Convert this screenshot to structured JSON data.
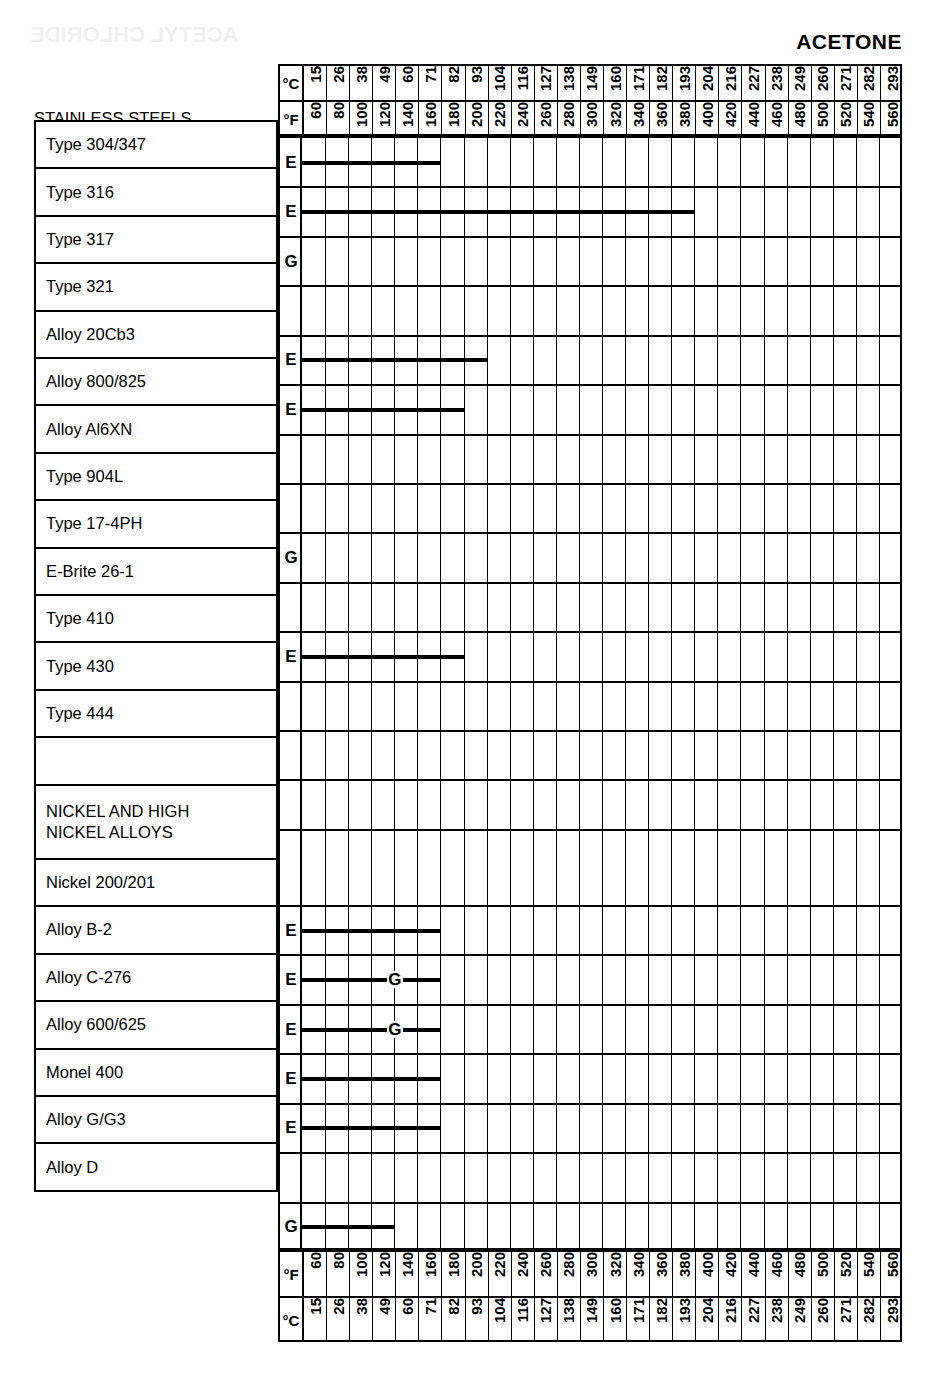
{
  "title": "ACETONE",
  "bleedthrough_text": "ACETYL CHLORIDE",
  "axis": {
    "celsius_label": "°C",
    "fahrenheit_label": "°F",
    "celsius_ticks": [
      "15",
      "26",
      "38",
      "49",
      "60",
      "71",
      "82",
      "93",
      "104",
      "116",
      "127",
      "138",
      "149",
      "160",
      "171",
      "182",
      "193",
      "204",
      "216",
      "227",
      "238",
      "249",
      "260",
      "271",
      "282",
      "293"
    ],
    "fahrenheit_ticks": [
      "60",
      "80",
      "100",
      "120",
      "140",
      "160",
      "180",
      "200",
      "220",
      "240",
      "260",
      "280",
      "300",
      "320",
      "340",
      "360",
      "380",
      "400",
      "420",
      "440",
      "460",
      "480",
      "500",
      "520",
      "540",
      "560"
    ]
  },
  "sections": {
    "stainless_label": "STAINLESS STEELS",
    "nickel_label": "NICKEL AND HIGH\nNICKEL ALLOYS"
  },
  "chart_data": {
    "type": "bar",
    "title": "ACETONE",
    "xlabel": "Temperature",
    "ylabel": "Alloy",
    "x_axis_primary": "°F",
    "x_axis_secondary": "°C",
    "x_ticks_f": [
      60,
      80,
      100,
      120,
      140,
      160,
      180,
      200,
      220,
      240,
      260,
      280,
      300,
      320,
      340,
      360,
      380,
      400,
      420,
      440,
      460,
      480,
      500,
      520,
      540,
      560
    ],
    "x_ticks_c": [
      15,
      26,
      38,
      49,
      60,
      71,
      82,
      93,
      104,
      116,
      127,
      138,
      149,
      160,
      171,
      182,
      193,
      204,
      216,
      227,
      238,
      249,
      260,
      271,
      282,
      293
    ],
    "xlim_f": [
      60,
      560
    ],
    "grid": true,
    "legend": "none",
    "rating_codes": {
      "E": "Excellent",
      "G": "Good"
    },
    "categories": [
      "Type 304/347",
      "Type 316",
      "Type 317",
      "Type 321",
      "Alloy 20Cb3",
      "Alloy 800/825",
      "Alloy Al6XN",
      "Type 904L",
      "Type 17-4PH",
      "E-Brite 26-1",
      "Type 410",
      "Type 430",
      "Type 444",
      "",
      "NICKEL AND HIGH NICKEL ALLOYS",
      "Nickel 200/201",
      "Alloy B-2",
      "Alloy C-276",
      "Alloy 600/625",
      "Monel 400",
      "Alloy G/G3",
      "Alloy D"
    ],
    "rows": [
      {
        "material": "Type 304/347",
        "rating": "E",
        "bar_start_f": 60,
        "bar_end_f": 180,
        "markers": []
      },
      {
        "material": "Type 316",
        "rating": "E",
        "bar_start_f": 60,
        "bar_end_f": 400,
        "markers": []
      },
      {
        "material": "Type 317",
        "rating": "G",
        "bar_start_f": null,
        "bar_end_f": null,
        "markers": []
      },
      {
        "material": "Type 321",
        "rating": "",
        "bar_start_f": null,
        "bar_end_f": null,
        "markers": []
      },
      {
        "material": "Alloy 20Cb3",
        "rating": "E",
        "bar_start_f": 60,
        "bar_end_f": 220,
        "markers": []
      },
      {
        "material": "Alloy 800/825",
        "rating": "E",
        "bar_start_f": 60,
        "bar_end_f": 200,
        "markers": []
      },
      {
        "material": "Alloy Al6XN",
        "rating": "",
        "bar_start_f": null,
        "bar_end_f": null,
        "markers": []
      },
      {
        "material": "Type 904L",
        "rating": "",
        "bar_start_f": null,
        "bar_end_f": null,
        "markers": []
      },
      {
        "material": "Type 17-4PH",
        "rating": "G",
        "bar_start_f": null,
        "bar_end_f": null,
        "markers": []
      },
      {
        "material": "E-Brite 26-1",
        "rating": "",
        "bar_start_f": null,
        "bar_end_f": null,
        "markers": []
      },
      {
        "material": "Type 410",
        "rating": "E",
        "bar_start_f": 60,
        "bar_end_f": 200,
        "markers": []
      },
      {
        "material": "Type 430",
        "rating": "",
        "bar_start_f": null,
        "bar_end_f": null,
        "markers": []
      },
      {
        "material": "Type 444",
        "rating": "",
        "bar_start_f": null,
        "bar_end_f": null,
        "markers": []
      },
      {
        "material": "",
        "rating": "",
        "bar_start_f": null,
        "bar_end_f": null,
        "markers": []
      },
      {
        "material": "NICKEL AND HIGH NICKEL ALLOYS",
        "rating": "",
        "bar_start_f": null,
        "bar_end_f": null,
        "markers": []
      },
      {
        "material": "Nickel 200/201",
        "rating": "E",
        "bar_start_f": 60,
        "bar_end_f": 180,
        "markers": []
      },
      {
        "material": "Alloy B-2",
        "rating": "E",
        "bar_start_f": 60,
        "bar_end_f": 180,
        "markers": [
          {
            "label": "G",
            "at_f": 140
          }
        ]
      },
      {
        "material": "Alloy C-276",
        "rating": "E",
        "bar_start_f": 60,
        "bar_end_f": 180,
        "markers": [
          {
            "label": "G",
            "at_f": 140
          }
        ]
      },
      {
        "material": "Alloy 600/625",
        "rating": "E",
        "bar_start_f": 60,
        "bar_end_f": 180,
        "markers": []
      },
      {
        "material": "Monel 400",
        "rating": "E",
        "bar_start_f": 60,
        "bar_end_f": 180,
        "markers": []
      },
      {
        "material": "Alloy G/G3",
        "rating": "",
        "bar_start_f": null,
        "bar_end_f": null,
        "markers": []
      },
      {
        "material": "Alloy D",
        "rating": "G",
        "bar_start_f": 60,
        "bar_end_f": 140,
        "markers": []
      }
    ]
  }
}
